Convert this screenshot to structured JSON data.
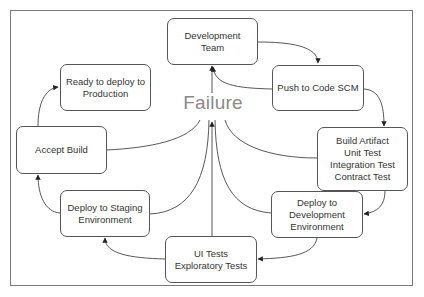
{
  "diagram": {
    "type": "ci-cd-pipeline-cycle",
    "center_label": "Failure",
    "nodes": [
      {
        "id": "dev-team",
        "lines": [
          "Development Team"
        ]
      },
      {
        "id": "push-scm",
        "lines": [
          "Push to Code SCM"
        ]
      },
      {
        "id": "build",
        "lines": [
          "Build Artifact",
          "Unit Test",
          "Integration Test",
          "Contract Test"
        ]
      },
      {
        "id": "deploy-dev",
        "lines": [
          "Deploy to",
          "Development",
          "Environment"
        ]
      },
      {
        "id": "ui-tests",
        "lines": [
          "UI Tests",
          "Exploratory Tests"
        ]
      },
      {
        "id": "deploy-staging",
        "lines": [
          "Deploy to Staging",
          "Environment"
        ]
      },
      {
        "id": "accept-build",
        "lines": [
          "Accept Build"
        ]
      },
      {
        "id": "ready-prod",
        "lines": [
          "Ready to deploy to",
          "Production"
        ]
      }
    ],
    "edges": [
      {
        "from": "dev-team",
        "to": "push-scm"
      },
      {
        "from": "push-scm",
        "to": "build"
      },
      {
        "from": "build",
        "to": "deploy-dev"
      },
      {
        "from": "deploy-dev",
        "to": "ui-tests"
      },
      {
        "from": "ui-tests",
        "to": "deploy-staging"
      },
      {
        "from": "deploy-staging",
        "to": "accept-build"
      },
      {
        "from": "accept-build",
        "to": "ready-prod"
      },
      {
        "from": "push-scm",
        "to": "dev-team",
        "label": "Failure"
      },
      {
        "from": "build",
        "to": "dev-team",
        "label": "Failure"
      },
      {
        "from": "deploy-dev",
        "to": "dev-team",
        "label": "Failure"
      },
      {
        "from": "ui-tests",
        "to": "dev-team",
        "label": "Failure"
      },
      {
        "from": "deploy-staging",
        "to": "dev-team",
        "label": "Failure"
      },
      {
        "from": "accept-build",
        "to": "dev-team",
        "label": "Failure"
      }
    ],
    "colors": {
      "border": "#555555",
      "frame": "#7a7a7a",
      "text": "#333333",
      "failure_text": "#8a8a8a",
      "edge": "#444444"
    }
  }
}
